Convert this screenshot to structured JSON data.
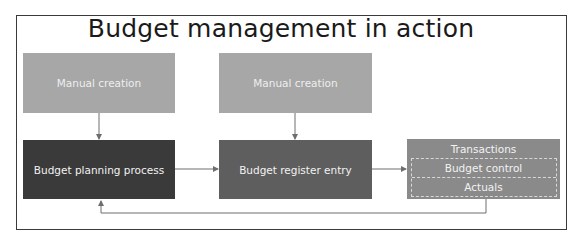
{
  "title": "Budget management in action",
  "colors": {
    "light_box": "#a7a7a7",
    "planning_box": "#3a3a3a",
    "register_box": "#5e5e5e",
    "transactions_box": "#8a8a8a",
    "connector": "#6e6e6e",
    "frame": "#3a3a3a"
  },
  "nodes": {
    "manual_creation_1": "Manual creation",
    "manual_creation_2": "Manual creation",
    "budget_planning": "Budget planning process",
    "budget_register": "Budget register entry",
    "transactions": {
      "title": "Transactions",
      "items": [
        "Budget control",
        "Actuals"
      ]
    }
  },
  "edges": [
    {
      "from": "manual_creation_1",
      "to": "budget_planning"
    },
    {
      "from": "manual_creation_2",
      "to": "budget_register"
    },
    {
      "from": "budget_planning",
      "to": "budget_register"
    },
    {
      "from": "budget_register",
      "to": "transactions"
    },
    {
      "from": "transactions",
      "to": "budget_planning",
      "type": "feedback"
    }
  ]
}
